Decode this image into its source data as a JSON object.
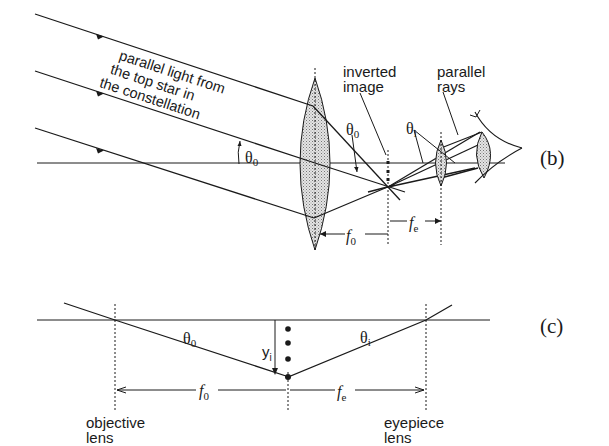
{
  "panel_b": {
    "tag": "(b)",
    "ray_label": [
      "parallel light from",
      "the top star in",
      "the constellation"
    ],
    "theta_o": "θ",
    "theta_o_sub": "0",
    "theta_i": "θ",
    "theta_i_sub": "i",
    "inverted_image": [
      "inverted",
      "image"
    ],
    "parallel_rays": [
      "parallel",
      "rays"
    ],
    "f_o": "f",
    "f_o_sub": "0",
    "f_e": "f",
    "f_e_sub": "e",
    "cut_text": "ever    ce"
  },
  "panel_c": {
    "tag": "(c)",
    "theta_o": "θ",
    "theta_o_sub": "0",
    "theta_i": "θ",
    "theta_i_sub": "i",
    "y_i": "y",
    "y_i_sub": "i",
    "f_o": "f",
    "f_o_sub": "0",
    "f_e": "f",
    "f_e_sub": "e",
    "objective_label": [
      "objective",
      "lens"
    ],
    "eyepiece_label": [
      "eyepiece",
      "lens"
    ]
  },
  "colors": {
    "ink": "#1a1a1a",
    "lens_fill": "#c8c8c8"
  }
}
